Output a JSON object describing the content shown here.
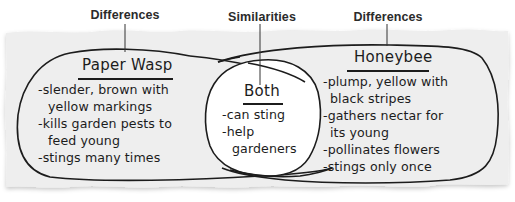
{
  "labels": {
    "left": "Differences",
    "center": "Similarities",
    "right": "Differences"
  },
  "left_set": {
    "title": "Paper Wasp",
    "items": [
      "-slender, brown with",
      "yellow markings",
      "-kills garden pests to",
      "feed young",
      "-stings many times"
    ]
  },
  "overlap": {
    "title": "Both",
    "items": [
      "-can sting",
      "-help",
      "gardeners"
    ]
  },
  "right_set": {
    "title": "Honeybee",
    "items": [
      "-plump, yellow with",
      "black stripes",
      "-gathers nectar for",
      "its young",
      "-pollinates flowers",
      "-stings only once"
    ]
  },
  "colors": {
    "paper": "#eeeeee",
    "overlap_fill": "#ffffff",
    "ink": "#1c1c1c",
    "label": "#2b2b2b"
  }
}
